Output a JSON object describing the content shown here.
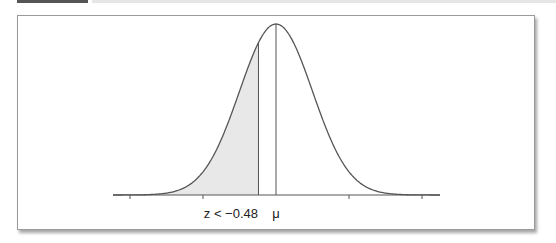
{
  "figure": {
    "type": "normal-distribution-diagram",
    "labels": {
      "z_cut": "z < −0.48",
      "mean": "μ"
    },
    "z_value": -0.48,
    "shaded_region": "left tail z < -0.48",
    "colors": {
      "curve": "#555555",
      "shade": "#e8e8e8",
      "frame": "#9a9a9a",
      "topbar": "#555555"
    }
  }
}
